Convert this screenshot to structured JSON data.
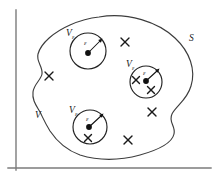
{
  "figure": {
    "labels": {
      "surface": "S",
      "volume": "V",
      "small_volume_symbol": "V",
      "small_volume_subscript": "ε",
      "radius_symbol": "ε"
    },
    "axes": {
      "vertical_present": true,
      "horizontal_present": true,
      "color": "#7b7b7b"
    },
    "colors": {
      "outline": "#3d3d3d",
      "circle": "#222222",
      "charge": "#111111",
      "cross": "#1a1a1a",
      "axis": "#7b7b7b",
      "background": "#ffffff"
    },
    "small_volumes": [
      {
        "name": "top-left-excluded-volume",
        "cx": 88,
        "cy": 51,
        "r": 18,
        "label_x": 66,
        "label_y": 33,
        "eps_label_x": 84,
        "eps_label_y": 43,
        "arrow_to_x": 101,
        "arrow_to_y": 39,
        "dot_x": 88,
        "dot_y": 53,
        "dot_r": 2.9,
        "inner_crosses": []
      },
      {
        "name": "middle-right-excluded-volume",
        "cx": 146,
        "cy": 82,
        "r": 16,
        "label_x": 126,
        "label_y": 64,
        "eps_label_x": 144,
        "eps_label_y": 74,
        "arrow_to_x": 158,
        "arrow_to_y": 70,
        "dot_x": 146,
        "dot_y": 81,
        "dot_r": 2.9,
        "inner_crosses": [
          {
            "x": 136,
            "y": 80
          },
          {
            "x": 151,
            "y": 90
          }
        ]
      },
      {
        "name": "bottom-left-excluded-volume",
        "cx": 90,
        "cy": 127,
        "r": 17,
        "label_x": 69,
        "label_y": 110,
        "eps_label_x": 87,
        "eps_label_y": 119,
        "arrow_to_x": 103,
        "arrow_to_y": 114,
        "dot_x": 89,
        "dot_y": 127,
        "dot_r": 2.9,
        "inner_crosses": [
          {
            "x": 88,
            "y": 138
          }
        ]
      }
    ],
    "outer_crosses": [
      {
        "name": "cross-top-middle",
        "x": 125,
        "y": 42
      },
      {
        "name": "cross-left-middle",
        "x": 49,
        "y": 76
      },
      {
        "name": "cross-right-lower",
        "x": 152,
        "y": 112
      },
      {
        "name": "cross-bottom-middle",
        "x": 128,
        "y": 140
      }
    ],
    "label_positions": {
      "surface_x": 189,
      "surface_y": 41,
      "volume_x": 35,
      "volume_y": 118
    }
  }
}
